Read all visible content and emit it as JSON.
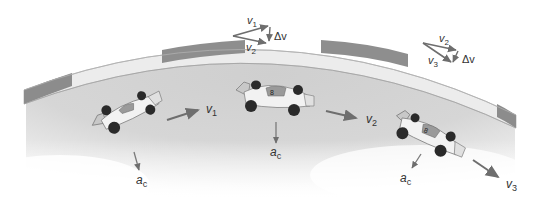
{
  "diagram": {
    "colors": {
      "track_surface": "#d4d4d4",
      "wall_dark": "#8a8a8a",
      "wall_light": "#ececec",
      "arrow": "#7a7a7a",
      "text": "#333333",
      "background": "#ffffff"
    },
    "cars": [
      {
        "id": "car1",
        "velocity_label": "v",
        "velocity_sub": "1",
        "accel_label": "a",
        "accel_sub": "c"
      },
      {
        "id": "car2",
        "velocity_label": "v",
        "velocity_sub": "2",
        "accel_label": "a",
        "accel_sub": "c",
        "number": "8"
      },
      {
        "id": "car3",
        "velocity_label": "v",
        "velocity_sub": "3",
        "accel_label": "a",
        "accel_sub": "c",
        "number": "8"
      }
    ],
    "vector_triangles": [
      {
        "id": "tri1",
        "top_label": "v",
        "top_sub": "1",
        "bottom_label": "v",
        "bottom_sub": "2",
        "delta_label": "Δv"
      },
      {
        "id": "tri2",
        "top_label": "v",
        "top_sub": "2",
        "bottom_label": "v",
        "bottom_sub": "3",
        "delta_label": "Δv"
      }
    ]
  }
}
